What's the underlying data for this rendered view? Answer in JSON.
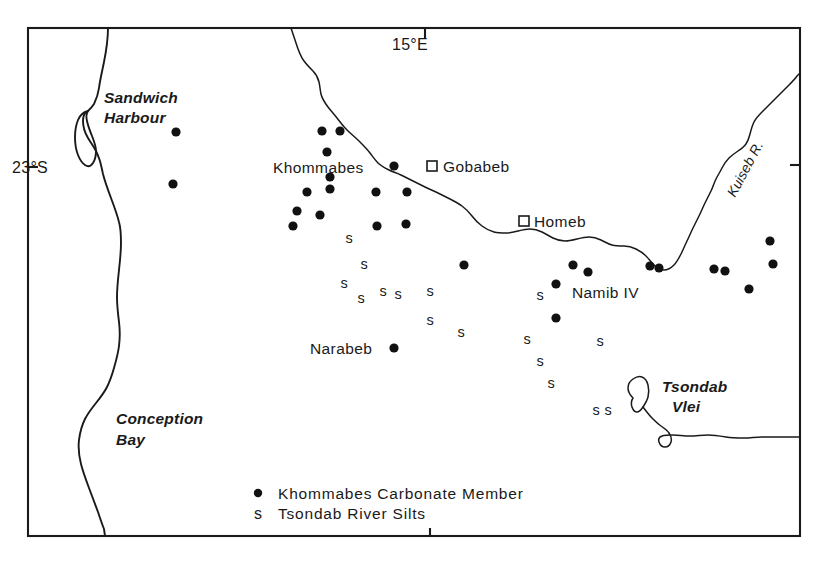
{
  "figure": {
    "type": "map",
    "region": "Central Namib Desert, Namibia",
    "frame": {
      "x": 28,
      "y": 28,
      "width": 772,
      "height": 508
    }
  },
  "graticule": {
    "longitude": {
      "label": "15°E",
      "tick_x": 425,
      "label_x": 410,
      "label_y": 50
    },
    "latitude": {
      "label": "23°S",
      "tick_y": 167,
      "label_x": 12,
      "label_y": 173
    },
    "bottom_tick_x": 430,
    "right_tick_y": 165
  },
  "geographic_features": [
    {
      "name": "Sandwich Harbour",
      "line1": "Sandwich",
      "line2": "Harbour",
      "x": 104,
      "y": 103,
      "type": "coastal-inlet"
    },
    {
      "name": "Conception Bay",
      "line1": "Conception",
      "line2": "Bay",
      "x": 116,
      "y": 424,
      "type": "coastal-bay"
    },
    {
      "name": "Tsondab Vlei",
      "line1": "Tsondab",
      "line2": "Vlei",
      "x": 662,
      "y": 392,
      "type": "ephemeral-pan"
    },
    {
      "name": "Kuiseb R.",
      "label": "Kuiseb R.",
      "type": "river"
    }
  ],
  "settlements": [
    {
      "name": "Khommabes",
      "label": "Khommabes",
      "label_x": 273,
      "label_y": 173,
      "marker": "dot",
      "marker_x": 394,
      "marker_y": 166
    },
    {
      "name": "Gobabeb",
      "label": "Gobabeb",
      "label_x": 443,
      "label_y": 172,
      "marker": "square",
      "marker_x": 432,
      "marker_y": 166
    },
    {
      "name": "Homeb",
      "label": "Homeb",
      "label_x": 534,
      "label_y": 227,
      "marker": "square",
      "marker_x": 524,
      "marker_y": 221
    },
    {
      "name": "Namib IV",
      "label": "Namib IV",
      "label_x": 572,
      "label_y": 298,
      "marker": "none"
    },
    {
      "name": "Narabeb",
      "label": "Narabeb",
      "label_x": 310,
      "label_y": 354,
      "marker": "dot",
      "marker_x": 394,
      "marker_y": 348
    }
  ],
  "legend": {
    "entries": [
      {
        "symbol": "dot",
        "label": "Khommabes  Carbonate  Member",
        "symbol_x": 258,
        "symbol_y": 493,
        "label_x": 278,
        "label_y": 499
      },
      {
        "symbol": "s",
        "label": "Tsondab  River  Silts",
        "symbol_x": 254,
        "symbol_y": 518,
        "label_x": 278,
        "label_y": 519
      }
    ]
  },
  "chart_data": {
    "type": "scatter",
    "title": "",
    "series": [
      {
        "name": "Khommabes Carbonate Member",
        "symbol": "dot",
        "count": 29,
        "points": [
          [
            176,
            132
          ],
          [
            173,
            184
          ],
          [
            322,
            131
          ],
          [
            340,
            131
          ],
          [
            327,
            152
          ],
          [
            330,
            177
          ],
          [
            307,
            192
          ],
          [
            297,
            211
          ],
          [
            330,
            189
          ],
          [
            293,
            226
          ],
          [
            320,
            215
          ],
          [
            376,
            192
          ],
          [
            407,
            192
          ],
          [
            394,
            166
          ],
          [
            377,
            226
          ],
          [
            406,
            224
          ],
          [
            464,
            265
          ],
          [
            573,
            265
          ],
          [
            588,
            272
          ],
          [
            556,
            284
          ],
          [
            556,
            318
          ],
          [
            650,
            266
          ],
          [
            659,
            268
          ],
          [
            714,
            269
          ],
          [
            770,
            241
          ],
          [
            773,
            264
          ],
          [
            725,
            271
          ],
          [
            749,
            289
          ],
          [
            394,
            348
          ]
        ]
      },
      {
        "name": "Tsondab River Silts",
        "symbol": "s",
        "count": 16,
        "points": [
          [
            349,
            243
          ],
          [
            364,
            269
          ],
          [
            361,
            303
          ],
          [
            383,
            296
          ],
          [
            398,
            299
          ],
          [
            430,
            325
          ],
          [
            461,
            337
          ],
          [
            527,
            344
          ],
          [
            540,
            366
          ],
          [
            551,
            388
          ],
          [
            596,
            415
          ],
          [
            608,
            415
          ],
          [
            600,
            346
          ],
          [
            344,
            288
          ],
          [
            430,
            296
          ],
          [
            540,
            300
          ]
        ]
      }
    ]
  }
}
